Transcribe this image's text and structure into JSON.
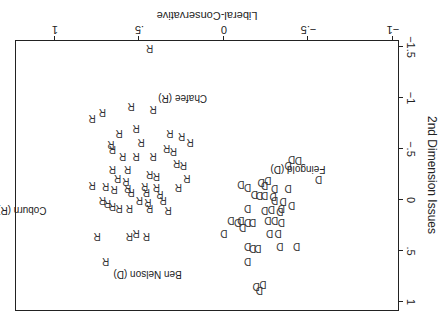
{
  "chart_data": {
    "type": "scatter",
    "title": "",
    "xlabel": "Liberal-Conservative",
    "ylabel": "2nd Dimension Issues",
    "xlim": [
      -1.0,
      1.05
    ],
    "ylim": [
      -1.6,
      1.1
    ],
    "xticks": [
      -1,
      -0.5,
      0,
      0.5,
      1
    ],
    "xtick_labels": [
      "−1",
      "−.5",
      "0",
      ".5",
      "1"
    ],
    "yticks": [
      -1.5,
      -1,
      -0.5,
      0,
      0.5,
      1
    ],
    "ytick_labels": [
      "−1.5",
      "−1",
      "−.5",
      "0",
      ".5",
      "1"
    ],
    "grid": false,
    "legend": null,
    "orientation_note": "figure rendered rotated 180 degrees",
    "series": [
      {
        "name": "R",
        "marker": "R",
        "points": [
          [
            0.44,
            -1.49
          ],
          [
            0.55,
            -0.92
          ],
          [
            0.42,
            -0.89
          ],
          [
            0.72,
            -0.86
          ],
          [
            0.52,
            -0.71
          ],
          [
            0.62,
            -0.66
          ],
          [
            0.78,
            -0.8
          ],
          [
            0.67,
            -0.55
          ],
          [
            0.66,
            -0.5
          ],
          [
            0.49,
            -0.57
          ],
          [
            0.6,
            -0.43
          ],
          [
            0.52,
            -0.43
          ],
          [
            0.42,
            -0.43
          ],
          [
            0.34,
            -0.51
          ],
          [
            0.3,
            -0.48
          ],
          [
            0.25,
            -0.63
          ],
          [
            0.32,
            -0.66
          ],
          [
            0.2,
            -0.57
          ],
          [
            0.57,
            -0.3
          ],
          [
            0.66,
            -0.3
          ],
          [
            0.63,
            -0.22
          ],
          [
            0.58,
            -0.19
          ],
          [
            0.44,
            -0.25
          ],
          [
            0.4,
            -0.24
          ],
          [
            0.28,
            -0.36
          ],
          [
            0.24,
            -0.34
          ],
          [
            0.22,
            -0.22
          ],
          [
            0.78,
            -0.15
          ],
          [
            0.7,
            -0.14
          ],
          [
            0.65,
            -0.11
          ],
          [
            0.57,
            -0.12
          ],
          [
            0.55,
            -0.08
          ],
          [
            0.47,
            -0.14
          ],
          [
            0.46,
            -0.08
          ],
          [
            0.4,
            -0.13
          ],
          [
            0.38,
            -0.06
          ],
          [
            0.27,
            -0.13
          ],
          [
            0.72,
            0.0
          ],
          [
            0.69,
            0.03
          ],
          [
            0.66,
            0.06
          ],
          [
            0.62,
            0.08
          ],
          [
            0.56,
            0.08
          ],
          [
            0.5,
            0.0
          ],
          [
            0.45,
            0.02
          ],
          [
            0.44,
            0.08
          ],
          [
            0.36,
            0.0
          ],
          [
            0.33,
            0.1
          ],
          [
            0.75,
            0.35
          ],
          [
            0.56,
            0.35
          ],
          [
            0.52,
            0.32
          ],
          [
            0.46,
            0.35
          ],
          [
            0.7,
            0.6
          ]
        ]
      },
      {
        "name": "D",
        "marker": "D",
        "points": [
          [
            -0.4,
            -0.4
          ],
          [
            -0.44,
            -0.39
          ],
          [
            -0.38,
            -0.34
          ],
          [
            -0.56,
            -0.21
          ],
          [
            -0.1,
            -0.16
          ],
          [
            -0.14,
            -0.13
          ],
          [
            -0.24,
            -0.15
          ],
          [
            -0.3,
            -0.12
          ],
          [
            -0.38,
            -0.12
          ],
          [
            -0.22,
            -0.18
          ],
          [
            -0.26,
            -0.2
          ],
          [
            -0.21,
            -0.05
          ],
          [
            -0.18,
            -0.06
          ],
          [
            -0.24,
            -0.05
          ],
          [
            -0.29,
            -0.04
          ],
          [
            -0.3,
            0.0
          ],
          [
            -0.35,
            0.01
          ],
          [
            -0.4,
            0.05
          ],
          [
            -0.14,
            0.08
          ],
          [
            -0.24,
            0.1
          ],
          [
            -0.34,
            0.08
          ],
          [
            -0.28,
            0.09
          ],
          [
            -0.33,
            0.11
          ],
          [
            -0.04,
            0.2
          ],
          [
            -0.08,
            0.22
          ],
          [
            -0.1,
            0.2
          ],
          [
            -0.14,
            0.22
          ],
          [
            -0.17,
            0.22
          ],
          [
            -0.11,
            0.26
          ],
          [
            -0.26,
            0.2
          ],
          [
            -0.3,
            0.2
          ],
          [
            -0.34,
            0.22
          ],
          [
            0.0,
            0.32
          ],
          [
            -0.27,
            0.32
          ],
          [
            -0.32,
            0.32
          ],
          [
            -0.14,
            0.45
          ],
          [
            -0.17,
            0.47
          ],
          [
            -0.2,
            0.47
          ],
          [
            -0.33,
            0.45
          ],
          [
            -0.43,
            0.45
          ],
          [
            -0.14,
            0.6
          ],
          [
            -0.19,
            0.84
          ],
          [
            -0.21,
            0.88
          ],
          [
            -0.23,
            0.82
          ]
        ]
      }
    ],
    "annotations": [
      {
        "text": "Chafee (R)",
        "x": 0.1,
        "y": -1.0
      },
      {
        "text": "Feingold (D)",
        "x": -0.6,
        "y": -0.3
      },
      {
        "text": "Coburn (R)",
        "x": 1.05,
        "y": 0.1
      },
      {
        "text": "Ben Nelson (D)",
        "x": 0.25,
        "y": 0.73
      }
    ]
  }
}
